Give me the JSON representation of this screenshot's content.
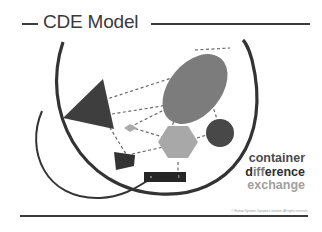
{
  "title": "CDE Model",
  "legend": {
    "line1": "container",
    "line2_start": "d",
    "line2_mid": "iff",
    "line2_end": "erence",
    "line3": "exchange"
  },
  "copyright": "© Human Systems Dynamics Institute. All rights reserved.",
  "colors": {
    "dark": "#3a3a3a",
    "mid_gray": "#7c7c7c",
    "light_gray": "#a8a8a8",
    "lighter_gray": "#b5b5b5",
    "background": "#ffffff"
  },
  "diagram": {
    "shapes": [
      "large-arc-container",
      "small-arc",
      "triangle",
      "ellipse",
      "circle",
      "hexagon",
      "diamond",
      "trapezoid",
      "rectangle"
    ],
    "connections": "dashed-lines"
  }
}
